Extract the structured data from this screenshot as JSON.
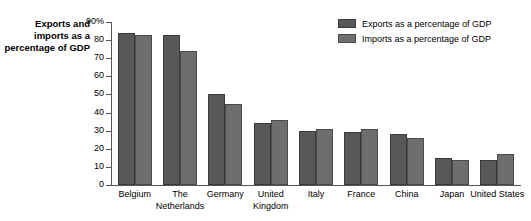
{
  "chart_data": {
    "type": "bar",
    "title": "Exports and imports as a percentage of GDP",
    "xlabel": "",
    "ylabel": "",
    "ylim": [
      0,
      90
    ],
    "grid": false,
    "legend_position": "top-right",
    "y_ticks": [
      "0",
      "10",
      "20",
      "30",
      "40",
      "50",
      "60",
      "70",
      "80",
      "90%"
    ],
    "y_tick_values": [
      0,
      10,
      20,
      30,
      40,
      50,
      60,
      70,
      80,
      90
    ],
    "categories": [
      "Belgium",
      "The Netherlands",
      "Germany",
      "United Kingdom",
      "Italy",
      "France",
      "China",
      "Japan",
      "United States"
    ],
    "series": [
      {
        "name": "Exports as a percentage of GDP",
        "color": "#585858",
        "values": [
          84,
          83,
          50,
          34,
          30,
          29,
          28,
          15,
          14
        ]
      },
      {
        "name": "Imports as a percentage of GDP",
        "color": "#6e6e6e",
        "values": [
          83,
          74,
          45,
          36,
          31,
          31,
          26,
          14,
          17
        ]
      }
    ]
  },
  "legend": {
    "items": [
      {
        "label": "Exports as a percentage of GDP"
      },
      {
        "label": "Imports as a percentage of GDP"
      }
    ]
  }
}
